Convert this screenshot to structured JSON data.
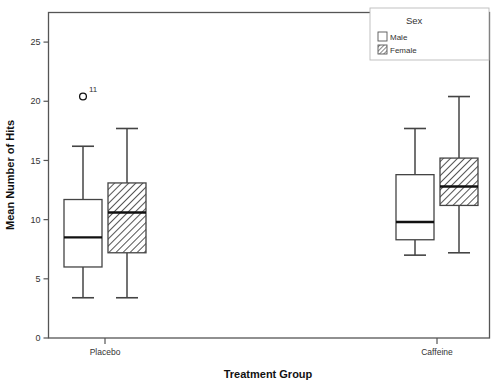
{
  "chart_data": {
    "type": "box",
    "title": "",
    "xlabel": "Treatment Group",
    "ylabel": "Mean Number of Hits",
    "ylim": [
      0,
      27.5
    ],
    "yticks": [
      0,
      5,
      10,
      15,
      20,
      25
    ],
    "ytick_labels": [
      "0",
      "5",
      "10",
      "15",
      "20",
      "25"
    ],
    "categories": [
      "Placebo",
      "Caffeine"
    ],
    "grid": false,
    "legend": {
      "title": "Sex",
      "position": "top-right",
      "entries": [
        {
          "label": "Male",
          "fill": "white",
          "pattern": "none"
        },
        {
          "label": "Female",
          "fill": "white",
          "pattern": "diagonal-hatch"
        }
      ]
    },
    "series": [
      {
        "name": "Male",
        "fill": "white",
        "pattern": "none",
        "boxes": [
          {
            "category": "Placebo",
            "whisker_low": 3.4,
            "q1": 6.0,
            "median": 8.5,
            "q3": 11.7,
            "whisker_high": 16.2,
            "outliers": [
              {
                "value": 20.4,
                "label": "11"
              }
            ]
          },
          {
            "category": "Caffeine",
            "whisker_low": 7.0,
            "q1": 8.3,
            "median": 9.8,
            "q3": 13.8,
            "whisker_high": 17.7,
            "outliers": []
          }
        ]
      },
      {
        "name": "Female",
        "fill": "white",
        "pattern": "diagonal-hatch",
        "boxes": [
          {
            "category": "Placebo",
            "whisker_low": 3.4,
            "q1": 7.2,
            "median": 10.6,
            "q3": 13.1,
            "whisker_high": 17.7,
            "outliers": []
          },
          {
            "category": "Caffeine",
            "whisker_low": 7.2,
            "q1": 11.2,
            "median": 12.8,
            "q3": 15.2,
            "whisker_high": 20.4,
            "outliers": []
          }
        ]
      }
    ]
  },
  "colors": {
    "frame": "#555555",
    "box_stroke": "#444444",
    "median": "#111111",
    "whisker": "#444444",
    "hatch": "#666666",
    "text": "#333333"
  }
}
